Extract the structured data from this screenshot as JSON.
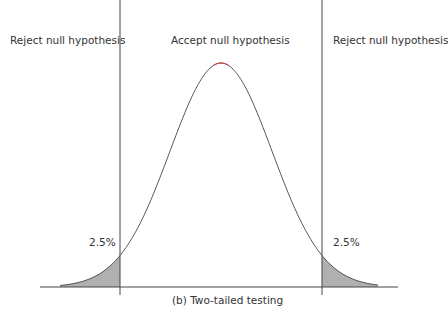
{
  "labels": {
    "reject_left": "Reject null hypothesis",
    "accept": "Accept null hypothesis",
    "reject_right": "Reject null hypothesis",
    "tail_left": "2.5%",
    "tail_right": "2.5%",
    "caption": "(b) Two-tailed testing"
  },
  "colors": {
    "line": "#444444",
    "curve": "#555555",
    "peak_accent": "#d04040",
    "shade": "#b0b0b0"
  },
  "geometry": {
    "baseline_y": 287,
    "baseline_x_start": 40,
    "baseline_x_end": 398,
    "left_critical_x": 120,
    "right_critical_x": 322,
    "peak_x": 221,
    "peak_y": 63,
    "sigma_px": 51
  }
}
